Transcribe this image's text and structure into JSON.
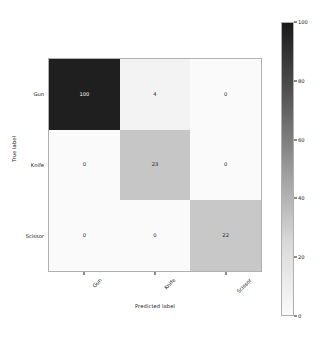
{
  "chart_data": {
    "type": "heatmap",
    "title": "",
    "xlabel": "Predicted label",
    "ylabel": "True label",
    "categories": [
      "Gun",
      "Knife",
      "Scissor"
    ],
    "x_tick_labels": [
      "Gun",
      "Knife",
      "Scissor"
    ],
    "y_tick_labels": [
      "Gun",
      "Knife",
      "Scissor"
    ],
    "rows": [
      {
        "label": "Gun",
        "values": [
          100,
          4,
          0
        ]
      },
      {
        "label": "Knife",
        "values": [
          0,
          23,
          0
        ]
      },
      {
        "label": "Scissor",
        "values": [
          0,
          0,
          22
        ]
      }
    ],
    "cells": [
      {
        "row": "Gun",
        "col": "Gun",
        "value": "100",
        "fill": "#1f1f1f",
        "text_color": "#ffffff"
      },
      {
        "row": "Gun",
        "col": "Knife",
        "value": "4",
        "fill": "#f3f3f3",
        "text_color": "#1a1a1a"
      },
      {
        "row": "Gun",
        "col": "Scissor",
        "value": "0",
        "fill": "#fafafa",
        "text_color": "#1a1a1a"
      },
      {
        "row": "Knife",
        "col": "Gun",
        "value": "0",
        "fill": "#fafafa",
        "text_color": "#1a1a1a"
      },
      {
        "row": "Knife",
        "col": "Knife",
        "value": "23",
        "fill": "#c6c6c6",
        "text_color": "#1a1a1a"
      },
      {
        "row": "Knife",
        "col": "Scissor",
        "value": "0",
        "fill": "#fafafa",
        "text_color": "#1a1a1a"
      },
      {
        "row": "Scissor",
        "col": "Gun",
        "value": "0",
        "fill": "#fafafa",
        "text_color": "#1a1a1a"
      },
      {
        "row": "Scissor",
        "col": "Knife",
        "value": "0",
        "fill": "#fafafa",
        "text_color": "#1a1a1a"
      },
      {
        "row": "Scissor",
        "col": "Scissor",
        "value": "22",
        "fill": "#c8c8c8",
        "text_color": "#1a1a1a"
      }
    ],
    "colorbar": {
      "ticks": [
        "0",
        "20",
        "40",
        "60",
        "80",
        "100"
      ],
      "vmin": 0,
      "vmax": 100,
      "colormap": "greys",
      "position": "right",
      "low_color": "#fafafa",
      "high_color": "#1a1a1a"
    },
    "grid": false,
    "legend_position": "none",
    "accent_color": "#1f1f1f"
  }
}
